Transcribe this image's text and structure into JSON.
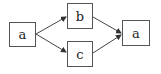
{
  "diagram": {
    "nodes": [
      {
        "id": "a1",
        "label": "a"
      },
      {
        "id": "b",
        "label": "b"
      },
      {
        "id": "c",
        "label": "c"
      },
      {
        "id": "a2",
        "label": "a"
      }
    ],
    "edges": [
      {
        "from": "a1",
        "to": "b"
      },
      {
        "from": "a1",
        "to": "c"
      },
      {
        "from": "b",
        "to": "a2"
      },
      {
        "from": "c",
        "to": "a2"
      }
    ],
    "colors": {
      "stroke": "#444444",
      "background": "#ffffff"
    }
  }
}
